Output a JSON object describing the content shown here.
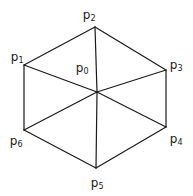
{
  "figure": {
    "background_color": "#ffffff",
    "stroke_color": "#1a1a1a",
    "label_color": "#1a1a1a",
    "stroke_width": 1.2,
    "width": 193,
    "height": 196
  },
  "nodes": [
    {
      "id": "p0",
      "base": "p",
      "sub": "0",
      "label": "p0",
      "x": 97,
      "y": 92,
      "label_x": 82,
      "label_y": 68
    },
    {
      "id": "p1",
      "base": "p",
      "sub": "1",
      "label": "p1",
      "x": 24,
      "y": 65,
      "label_x": 17,
      "label_y": 57
    },
    {
      "id": "p2",
      "base": "p",
      "sub": "2",
      "label": "p2",
      "x": 95,
      "y": 27,
      "label_x": 89,
      "label_y": 15
    },
    {
      "id": "p3",
      "base": "p",
      "sub": "3",
      "label": "p3",
      "x": 166,
      "y": 70,
      "label_x": 176,
      "label_y": 65
    },
    {
      "id": "p4",
      "base": "p",
      "sub": "4",
      "label": "p4",
      "x": 166,
      "y": 127,
      "label_x": 176,
      "label_y": 139
    },
    {
      "id": "p5",
      "base": "p",
      "sub": "5",
      "label": "p5",
      "x": 96,
      "y": 168,
      "label_x": 97,
      "label_y": 183
    },
    {
      "id": "p6",
      "base": "p",
      "sub": "6",
      "label": "p6",
      "x": 24,
      "y": 130,
      "label_x": 16,
      "label_y": 141
    }
  ],
  "edges": [
    {
      "id": "edge-p1-p2",
      "from": "p1",
      "to": "p2",
      "kind": "boundary"
    },
    {
      "id": "edge-p2-p3",
      "from": "p2",
      "to": "p3",
      "kind": "boundary"
    },
    {
      "id": "edge-p3-p4",
      "from": "p3",
      "to": "p4",
      "kind": "boundary"
    },
    {
      "id": "edge-p4-p5",
      "from": "p4",
      "to": "p5",
      "kind": "boundary"
    },
    {
      "id": "edge-p5-p6",
      "from": "p5",
      "to": "p6",
      "kind": "boundary"
    },
    {
      "id": "edge-p6-p1",
      "from": "p6",
      "to": "p1",
      "kind": "boundary"
    },
    {
      "id": "edge-p0-p1",
      "from": "p0",
      "to": "p1",
      "kind": "spoke"
    },
    {
      "id": "edge-p0-p2",
      "from": "p0",
      "to": "p2",
      "kind": "spoke"
    },
    {
      "id": "edge-p0-p3",
      "from": "p0",
      "to": "p3",
      "kind": "spoke"
    },
    {
      "id": "edge-p0-p4",
      "from": "p0",
      "to": "p4",
      "kind": "spoke"
    },
    {
      "id": "edge-p0-p5",
      "from": "p0",
      "to": "p5",
      "kind": "spoke"
    },
    {
      "id": "edge-p0-p6",
      "from": "p0",
      "to": "p6",
      "kind": "spoke"
    }
  ]
}
